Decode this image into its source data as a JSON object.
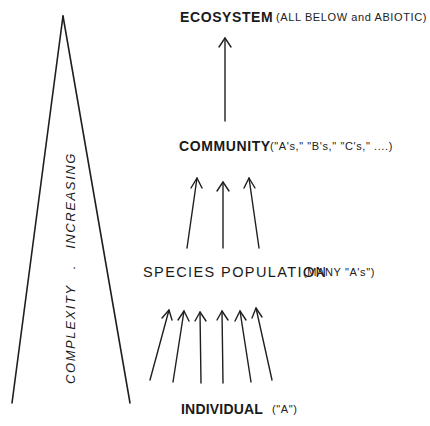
{
  "diagram": {
    "type": "hierarchy",
    "axis_label": {
      "word1": "COMPLEXITY",
      "separator": ".",
      "word2": "INCREASING"
    },
    "levels": [
      {
        "id": "ecosystem",
        "label": "ECOSYSTEM",
        "note": "(ALL BELOW and ABIOTIC)",
        "arrows_below_count": 1
      },
      {
        "id": "community",
        "label": "COMMUNITY",
        "note": "(\"A's,\"  \"B's,\"  \"C's,\" ....)",
        "arrows_below_count": 3
      },
      {
        "id": "species-population",
        "label": "SPECIES POPULATION",
        "note": "(MANY \"A's\")",
        "arrows_below_count": 6
      },
      {
        "id": "individual",
        "label": "INDIVIDUAL",
        "note": "(\"A\")",
        "arrows_below_count": 0
      }
    ],
    "colors": {
      "ink": "#1f1f1f",
      "background": "#ffffff"
    }
  }
}
